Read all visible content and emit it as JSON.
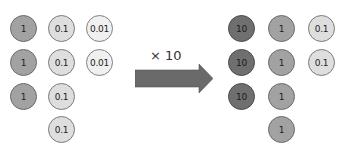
{
  "colors": {
    "v10": "#6f6f6f",
    "v1": "#a2a2a2",
    "v01": "#dedede",
    "v001": "#f0f0f0",
    "arrow": "#6a6a6a"
  },
  "arrow_label": "× 10",
  "before": {
    "columns": [
      {
        "value": "1",
        "count": 3,
        "labels": [
          "1",
          "1",
          "1"
        ]
      },
      {
        "value": "0.1",
        "count": 4,
        "labels": [
          "0.1",
          "0.1",
          "0.1",
          "0.1"
        ]
      },
      {
        "value": "0.01",
        "count": 2,
        "labels": [
          "0.01",
          "0.01"
        ]
      }
    ]
  },
  "after": {
    "columns": [
      {
        "value": "10",
        "count": 3,
        "labels": [
          "10",
          "10",
          "10"
        ]
      },
      {
        "value": "1",
        "count": 4,
        "labels": [
          "1",
          "1",
          "1",
          "1"
        ]
      },
      {
        "value": "0.1",
        "count": 2,
        "labels": [
          "0.1",
          "0.1"
        ]
      }
    ]
  }
}
